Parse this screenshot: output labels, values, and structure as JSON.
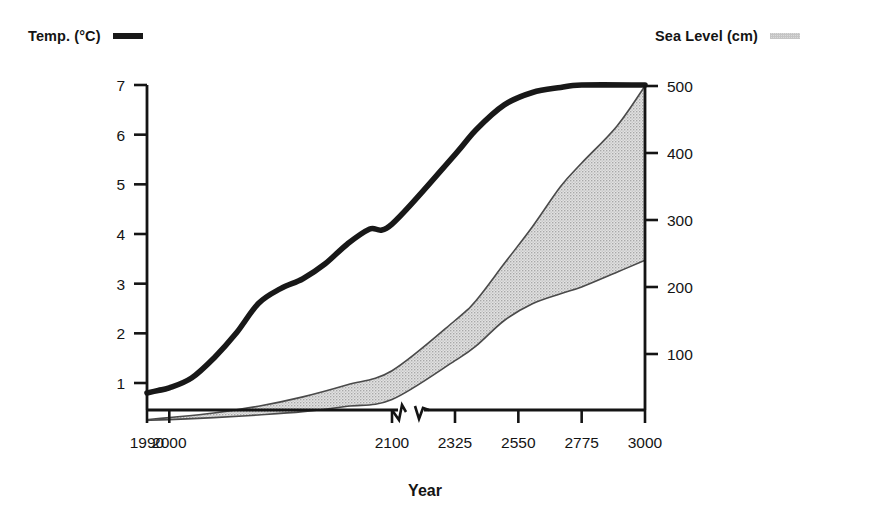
{
  "legend": {
    "temp": {
      "label": "Temp. (°C)",
      "swatch": "line-swatch",
      "color": "#181818"
    },
    "sea": {
      "label": "Sea Level (cm)",
      "swatch": "band-swatch",
      "color": "#d4d4d4"
    }
  },
  "chart_data": {
    "type": "line",
    "title": "",
    "subtitle": "",
    "xlabel": "Year",
    "ylabel": "",
    "grid": false,
    "legend_position": "top",
    "x_axis": {
      "label": "Year",
      "tick_labels": [
        "1990",
        "2000",
        "2100",
        "2325",
        "2550",
        "2775",
        "3000"
      ],
      "tick_values": [
        1990,
        2000,
        2100,
        2325,
        2550,
        2775,
        3000
      ],
      "axis_break": true,
      "axis_break_between": [
        2100,
        2325
      ]
    },
    "y_axis_left": {
      "label": "Temp. (°C)",
      "tick_labels": [
        "1",
        "2",
        "3",
        "4",
        "5",
        "6",
        "7"
      ],
      "tick_values": [
        1,
        2,
        3,
        4,
        5,
        6,
        7
      ],
      "ylim": [
        0.35,
        7.0
      ]
    },
    "y_axis_right": {
      "label": "Sea Level (cm)",
      "tick_labels": [
        "100",
        "200",
        "300",
        "400",
        "500"
      ],
      "tick_values": [
        100,
        200,
        300,
        400,
        500
      ],
      "ylim": [
        0,
        520
      ]
    },
    "series": [
      {
        "name": "Temp. (°C)",
        "axis": "left",
        "style": "thick-line",
        "color": "#181818",
        "x": [
          1990,
          1995,
          2000,
          2010,
          2020,
          2030,
          2040,
          2050,
          2060,
          2070,
          2080,
          2090,
          2100,
          2325,
          2400,
          2500,
          2600,
          2700,
          2775,
          3000
        ],
        "values": [
          0.8,
          0.85,
          0.9,
          1.1,
          1.5,
          2.0,
          2.6,
          2.9,
          3.1,
          3.4,
          3.8,
          4.1,
          4.2,
          5.6,
          6.1,
          6.6,
          6.85,
          6.95,
          7.0,
          7.0
        ]
      },
      {
        "name": "Sea Level (cm) – upper bound",
        "axis": "right",
        "style": "band-edge",
        "color": "#5a5a5a",
        "x": [
          1990,
          2000,
          2020,
          2040,
          2060,
          2080,
          2100,
          2325,
          2400,
          2500,
          2600,
          2700,
          2775,
          2900,
          3000
        ],
        "values": [
          2,
          5,
          12,
          22,
          36,
          54,
          75,
          150,
          180,
          235,
          290,
          350,
          385,
          440,
          500
        ]
      },
      {
        "name": "Sea Level (cm) – lower bound",
        "axis": "right",
        "style": "band-edge",
        "color": "#5a5a5a",
        "x": [
          1990,
          2000,
          2020,
          2040,
          2060,
          2080,
          2100,
          2325,
          2400,
          2500,
          2600,
          2700,
          2775,
          2900,
          3000
        ],
        "values": [
          1,
          2,
          5,
          9,
          14,
          22,
          32,
          90,
          112,
          150,
          175,
          190,
          200,
          222,
          240
        ]
      }
    ],
    "band": {
      "name": "Sea level range",
      "fill": "#d0d0d0",
      "between": [
        "Sea Level (cm) – lower bound",
        "Sea Level (cm) – upper bound"
      ]
    }
  }
}
